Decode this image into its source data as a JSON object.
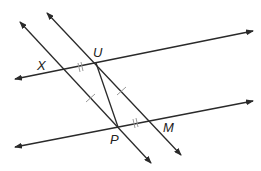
{
  "diagram": {
    "type": "geometry",
    "points": {
      "X": {
        "label": "X",
        "x": 63,
        "y": 69
      },
      "U": {
        "label": "U",
        "x": 96,
        "y": 63
      },
      "P": {
        "label": "P",
        "x": 118,
        "y": 127
      },
      "M": {
        "label": "M",
        "x": 153,
        "y": 120
      }
    },
    "lines": [
      {
        "id": "line-xu",
        "through": [
          "X",
          "U"
        ],
        "from": [
          15,
          79
        ],
        "to": [
          253,
          31
        ],
        "arrows": "both"
      },
      {
        "id": "line-pm",
        "through": [
          "P",
          "M"
        ],
        "from": [
          15,
          147
        ],
        "to": [
          253,
          101
        ],
        "arrows": "both"
      },
      {
        "id": "line-xp",
        "through": [
          "X",
          "P"
        ],
        "from": [
          20,
          22
        ],
        "to": [
          151,
          163
        ],
        "arrows": "both"
      },
      {
        "id": "line-um",
        "through": [
          "U",
          "M"
        ],
        "from": [
          47,
          13
        ],
        "to": [
          181,
          155
        ],
        "arrows": "both"
      }
    ],
    "segments": [
      {
        "id": "segment-up",
        "from": "U",
        "to": "P"
      }
    ],
    "tick_marks": [
      {
        "segment": "XU",
        "count": 2
      },
      {
        "segment": "PM",
        "count": 2
      },
      {
        "segment": "XP",
        "count": 1
      },
      {
        "segment": "UM",
        "count": 1
      }
    ],
    "colors": {
      "line": "#2a2a2a",
      "tick": "#9a9a9a",
      "background": "#ffffff"
    }
  }
}
